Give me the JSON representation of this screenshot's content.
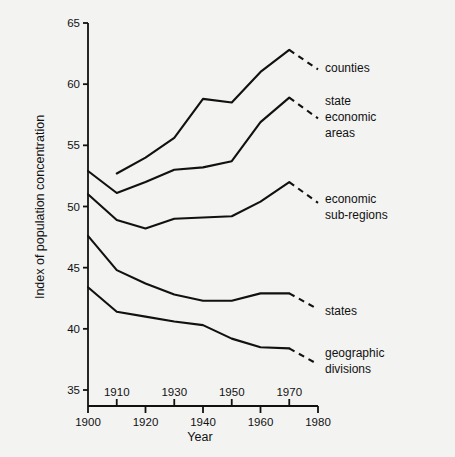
{
  "chart_data": {
    "type": "line",
    "title": "",
    "xlabel": "Year",
    "ylabel": "Index of population concentration",
    "xlim": [
      1900,
      1980
    ],
    "ylim": [
      33,
      65
    ],
    "grid": false,
    "legend_position": "right-inline-labels",
    "x_ticks_upper": [
      "1910",
      "1930",
      "1950",
      "1970"
    ],
    "x_ticks_lower": [
      "1900",
      "1920",
      "1940",
      "1960",
      "1980"
    ],
    "x_tick_values_upper": [
      1910,
      1930,
      1950,
      1970
    ],
    "x_tick_values_lower": [
      1900,
      1920,
      1940,
      1960,
      1980
    ],
    "y_ticks": [
      "65",
      "60",
      "55",
      "50",
      "45",
      "40",
      "35"
    ],
    "y_tick_values": [
      65,
      60,
      55,
      50,
      45,
      40,
      35
    ],
    "series": [
      {
        "name": "counties",
        "label": "counties",
        "x": [
          1910,
          1920,
          1930,
          1940,
          1950,
          1960,
          1970
        ],
        "values": [
          52.7,
          54.0,
          55.6,
          58.8,
          58.5,
          61.0,
          62.8
        ],
        "dash_end_x": 1980,
        "dash_end_value": 61.2
      },
      {
        "name": "state-economic-areas",
        "label": "state economic areas",
        "x": [
          1900,
          1910,
          1920,
          1930,
          1940,
          1950,
          1960,
          1970
        ],
        "values": [
          52.9,
          51.1,
          52.0,
          53.0,
          53.2,
          53.7,
          56.9,
          58.9
        ],
        "dash_end_x": 1980,
        "dash_end_value": 57.2
      },
      {
        "name": "economic-sub-regions",
        "label": "economic sub-regions",
        "x": [
          1900,
          1910,
          1920,
          1930,
          1940,
          1950,
          1960,
          1970
        ],
        "values": [
          51.0,
          48.9,
          48.2,
          49.0,
          49.1,
          49.2,
          50.4,
          52.0
        ],
        "dash_end_x": 1980,
        "dash_end_value": 50.3
      },
      {
        "name": "states",
        "label": "states",
        "x": [
          1900,
          1910,
          1920,
          1930,
          1940,
          1950,
          1960,
          1970
        ],
        "values": [
          47.6,
          44.8,
          43.7,
          42.8,
          42.3,
          42.3,
          42.9,
          42.9
        ],
        "dash_end_x": 1980,
        "dash_end_value": 41.6
      },
      {
        "name": "geographic-divisions",
        "label": "geographic divisions",
        "x": [
          1900,
          1910,
          1920,
          1930,
          1940,
          1950,
          1960,
          1970
        ],
        "values": [
          43.4,
          41.4,
          41.0,
          40.6,
          40.3,
          39.2,
          38.5,
          38.4
        ],
        "dash_end_x": 1980,
        "dash_end_value": 37.1
      }
    ],
    "series_labels": [
      {
        "id": "counties",
        "lines": [
          "counties"
        ]
      },
      {
        "id": "state-economic-areas",
        "lines": [
          "state",
          "economic",
          "areas"
        ]
      },
      {
        "id": "economic-sub-regions",
        "lines": [
          "economic",
          "sub-regions"
        ]
      },
      {
        "id": "states",
        "lines": [
          "states"
        ]
      },
      {
        "id": "geographic-divisions",
        "lines": [
          "geographic",
          "divisions"
        ]
      }
    ]
  }
}
